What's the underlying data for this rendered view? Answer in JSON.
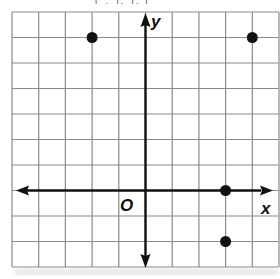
{
  "header_fragment": "( ,  ),  ),  (",
  "grid": {
    "columns": 10,
    "rows": 10,
    "x_min": -5,
    "x_max": 5,
    "y_min": -3,
    "y_max": 7,
    "line_color": "#8a8a8a",
    "axis_color": "#111111"
  },
  "axes": {
    "x_label": "x",
    "y_label": "y",
    "origin_label": "O"
  },
  "points": [
    {
      "x": -2,
      "y": 6
    },
    {
      "x": 4,
      "y": 6
    },
    {
      "x": 3,
      "y": 0
    },
    {
      "x": 3,
      "y": -2
    }
  ]
}
